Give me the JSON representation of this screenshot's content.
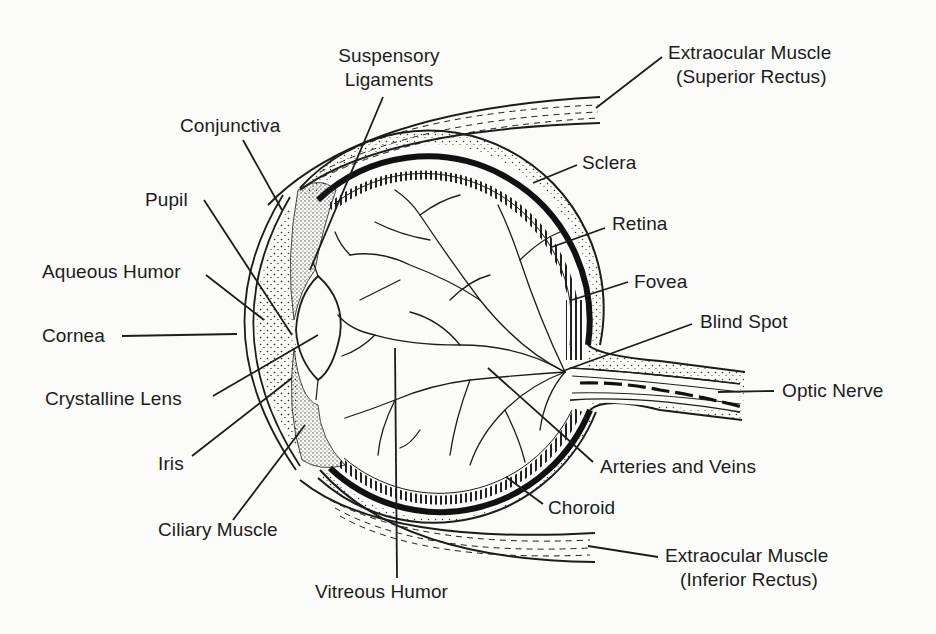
{
  "diagram": {
    "colors": {
      "ink": "#1c1c1c",
      "background": "#fbfbf9",
      "stipple": "#3a3a3a"
    },
    "labels": {
      "suspensory_ligaments": {
        "line1": "Suspensory",
        "line2": "Ligaments"
      },
      "conjunctiva": "Conjunctiva",
      "pupil": "Pupil",
      "aqueous_humor": "Aqueous Humor",
      "cornea": "Cornea",
      "crystalline_lens": "Crystalline Lens",
      "iris": "Iris",
      "ciliary_muscle": "Ciliary Muscle",
      "vitreous_humor": "Vitreous Humor",
      "superior_rectus": {
        "line1": "Extraocular Muscle",
        "line2": "(Superior Rectus)"
      },
      "sclera": "Sclera",
      "retina": "Retina",
      "fovea": "Fovea",
      "blind_spot": "Blind Spot",
      "optic_nerve": "Optic Nerve",
      "arteries_and_veins": "Arteries and Veins",
      "choroid": "Choroid",
      "inferior_rectus": {
        "line1": "Extraocular Muscle",
        "line2": "(Inferior Rectus)"
      }
    }
  }
}
